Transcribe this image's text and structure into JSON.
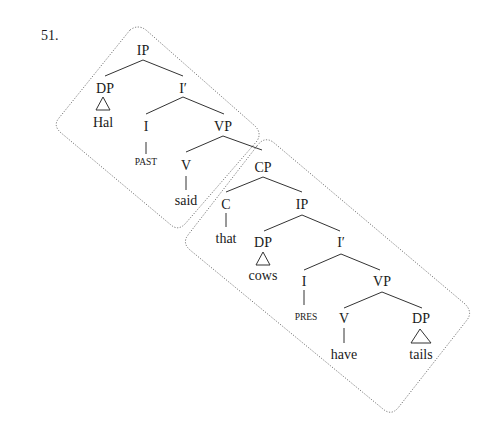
{
  "example_number": "51.",
  "tree": {
    "matrix": {
      "IP": "IP",
      "DP": "DP",
      "Hal": "Hal",
      "I_bar": "I′",
      "I": "I",
      "PAST": "PAST",
      "VP": "VP",
      "V": "V",
      "said": "said"
    },
    "embedded": {
      "CP": "CP",
      "C": "C",
      "that": "that",
      "IP": "IP",
      "DP": "DP",
      "cows": "cows",
      "I_bar": "I′",
      "I": "I",
      "PRES": "PRES",
      "VP": "VP",
      "V": "V",
      "have": "have",
      "DP2": "DP",
      "tails": "tails"
    }
  }
}
